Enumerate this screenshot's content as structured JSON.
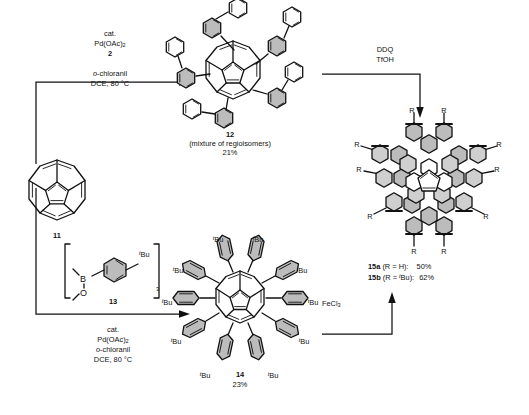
{
  "scheme": {
    "title": "Synthesis of warped nanographenes from corannulene",
    "compounds": [
      {
        "id": "11",
        "label": "11",
        "name": "corannulene",
        "caption_lines": [
          "11"
        ]
      },
      {
        "id": "12",
        "label": "12",
        "name": "pentakis(biphenyl-2-yl)corannulene",
        "caption_lines": [
          "12",
          "(mixture of regioisomers)",
          "21%"
        ],
        "note": "(mixture of regioisomers)",
        "yield": "21%"
      },
      {
        "id": "13",
        "label": "13",
        "name": "tris(4-tert-butylphenyl)boroxine",
        "caption_lines": [
          "13"
        ],
        "bracket_subscript": "3",
        "atom_b": "B",
        "atom_o": "O",
        "substituent": "tBu"
      },
      {
        "id": "14",
        "label": "14",
        "name": "decakis(4-tert-butylphenyl)corannulene",
        "caption_lines": [
          "14",
          "23%"
        ],
        "yield": "23%",
        "substituent": "tBu"
      },
      {
        "id": "15",
        "label": "15",
        "name": "warped nanographene",
        "caption_lines": [
          "15a (R = H):  50%",
          "15b (R = tBu): 62%"
        ],
        "variants": [
          {
            "label": "15a",
            "condition": "(R = H):",
            "yield": "50%"
          },
          {
            "label": "15b",
            "condition": "(R = tBu):",
            "yield": "62%"
          }
        ],
        "substituent_label": "R"
      }
    ],
    "arrows": [
      {
        "id": "arrow-top",
        "direction": "right",
        "above_lines": [
          "cat.",
          "Pd(OAc)2",
          "2"
        ],
        "below_lines": [
          "o-chloranil",
          "DCE, 80 °C"
        ]
      },
      {
        "id": "arrow-ddq",
        "direction": "right-then-down",
        "above_lines": [
          "DDQ",
          "TfOH"
        ],
        "below_lines": []
      },
      {
        "id": "arrow-bottom",
        "direction": "right",
        "above_lines": [
          "13"
        ],
        "below_lines": [
          "cat.",
          "Pd(OAc)2",
          "o-chloranil",
          "DCE, 80 °C"
        ]
      },
      {
        "id": "arrow-fecl3",
        "direction": "right-then-up",
        "above_lines": [
          "FeCl3"
        ],
        "below_lines": []
      }
    ],
    "text": {
      "cat": "cat.",
      "pd_oac": "Pd(OAc)",
      "pd_oac_sub": "2",
      "reagent_2": "2",
      "o_prefix": "o",
      "chloranil": "-chloranil",
      "dce": "DCE, 80 °C",
      "ddq": "DDQ",
      "tfoh": "TfOH",
      "fecl3": "FeCl",
      "fecl3_sub": "3",
      "label_11": "11",
      "label_12": "12",
      "regioisomers": "(mixture of regioisomers)",
      "yield_12": "21%",
      "label_13": "13",
      "label_14": "14",
      "yield_14": "23%",
      "label_15a": "15a",
      "cond_15a": "(R = H):",
      "yield_15a": "50%",
      "label_15b": "15b",
      "cond_15b": "(R = ",
      "cond_15b_sup": "t",
      "cond_15b_end": "Bu):",
      "yield_15b": "62%",
      "tbu_sup": "t",
      "tbu": "Bu",
      "r_group": "R",
      "atom_b": "B",
      "atom_o": "O",
      "bracket_sub": "3"
    },
    "colors": {
      "line": "#111111",
      "ring_shaded": "#c4c4c4",
      "ring_shaded_light": "#d4d4d4",
      "background": "#ffffff"
    }
  }
}
